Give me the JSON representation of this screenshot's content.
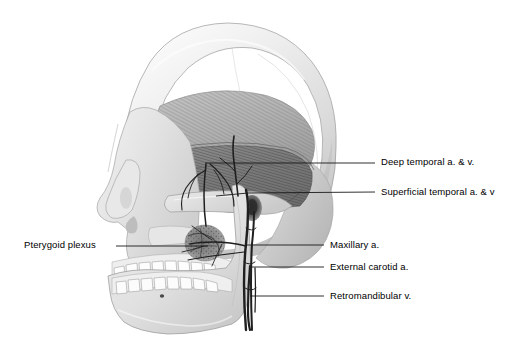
{
  "figure": {
    "view": "left lateral",
    "style": "grayscale anatomical illustration",
    "background_color": "#ffffff",
    "label_text_color": "#000000",
    "leader_line_color": "#1a1a1a",
    "width": 520,
    "height": 362
  },
  "labels": [
    {
      "id": "deep-temporal",
      "text": "Deep temporal a. & v.",
      "side": "right",
      "text_x": 381,
      "text_y": 156,
      "leader": {
        "x1": 205,
        "y1": 163,
        "x2": 375,
        "y2": 163
      }
    },
    {
      "id": "superficial-temporal",
      "text": "Superficial temporal a. & v",
      "side": "right",
      "text_x": 381,
      "text_y": 186,
      "leader": {
        "x1": 216,
        "y1": 196,
        "x2": 375,
        "y2": 192
      }
    },
    {
      "id": "pterygoid-plexus",
      "text": "Pterygoid plexus",
      "side": "left",
      "text_x": 24,
      "text_y": 239,
      "leader": {
        "x1": 116,
        "y1": 246,
        "x2": 208,
        "y2": 246
      }
    },
    {
      "id": "maxillary-artery",
      "text": "Maxillary a.",
      "side": "right",
      "text_x": 330,
      "text_y": 239,
      "leader": {
        "x1": 246,
        "y1": 245,
        "x2": 324,
        "y2": 245
      }
    },
    {
      "id": "external-carotid-artery",
      "text": "External carotid a.",
      "side": "right",
      "text_x": 330,
      "text_y": 261,
      "leader": {
        "x1": 252,
        "y1": 267,
        "x2": 324,
        "y2": 267
      }
    },
    {
      "id": "retromandibular-vein",
      "text": "Retromandibular v.",
      "side": "right",
      "text_x": 330,
      "text_y": 290,
      "leader": {
        "x1": 250,
        "y1": 296,
        "x2": 324,
        "y2": 296
      }
    }
  ],
  "structures": [
    {
      "id": "cranium",
      "name": "cranial vault"
    },
    {
      "id": "temporalis",
      "name": "temporalis muscle"
    },
    {
      "id": "zygomatic-arch",
      "name": "zygomatic arch"
    },
    {
      "id": "maxilla",
      "name": "maxilla"
    },
    {
      "id": "mandible",
      "name": "mandible"
    },
    {
      "id": "maxillary-teeth",
      "name": "maxillary teeth"
    },
    {
      "id": "mandibular-teeth",
      "name": "mandibular teeth"
    },
    {
      "id": "external-acoustic-meatus",
      "name": "external acoustic meatus"
    },
    {
      "id": "mental-foramen",
      "name": "mental foramen"
    },
    {
      "id": "nasal-aperture",
      "name": "nasal aperture"
    },
    {
      "id": "orbit",
      "name": "orbital margin"
    },
    {
      "id": "vessel-network",
      "name": "maxillofacial vessel network"
    }
  ]
}
